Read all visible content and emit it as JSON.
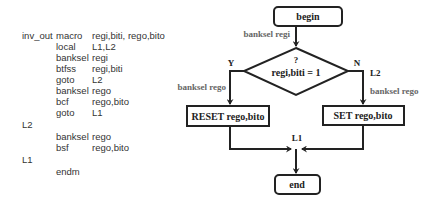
{
  "code": {
    "lines": [
      {
        "label": "inv_out",
        "op": "macro",
        "args": "regi,biti, rego,bito"
      },
      {
        "label": "",
        "op": "local",
        "args": "L1,L2"
      },
      {
        "label": "",
        "op": "banksel",
        "args": "regi"
      },
      {
        "label": "",
        "op": "btfss",
        "args": "regi,biti"
      },
      {
        "label": "",
        "op": "goto",
        "args": "L2"
      },
      {
        "label": "",
        "op": "banksel",
        "args": "rego"
      },
      {
        "label": "",
        "op": "bcf",
        "args": "rego,bito"
      },
      {
        "label": "",
        "op": "goto",
        "args": "L1"
      },
      {
        "label": "L2",
        "op": "",
        "args": ""
      },
      {
        "label": "",
        "op": "banksel",
        "args": "rego"
      },
      {
        "label": "",
        "op": "bsf",
        "args": "rego,bito"
      },
      {
        "label": "L1",
        "op": "",
        "args": ""
      },
      {
        "label": "",
        "op": "endm",
        "args": ""
      }
    ]
  },
  "flowchart": {
    "begin": "begin",
    "begin_arrow_label": "banksel regi",
    "decision_q": "?",
    "decision_text": "regi,biti = 1",
    "yes_label": "Y",
    "no_label": "N",
    "no_target_label": "L2",
    "yes_arrow_label": "banksel rego",
    "no_arrow_label": "banksel rego",
    "reset_box": "RESET rego,bito",
    "set_box": "SET rego,bito",
    "merge_label": "L1",
    "end": "end"
  }
}
